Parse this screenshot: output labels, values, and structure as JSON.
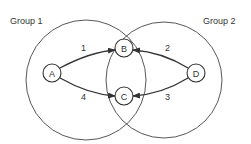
{
  "diagram": {
    "groups": [
      {
        "label": "Group 1",
        "cx": 86,
        "cy": 80,
        "r": 60
      },
      {
        "label": "Group 2",
        "cx": 164,
        "cy": 80,
        "r": 58
      }
    ],
    "nodes": [
      {
        "id": "A",
        "label": "A",
        "x": 52,
        "y": 73
      },
      {
        "id": "B",
        "label": "B",
        "x": 124,
        "y": 48
      },
      {
        "id": "C",
        "label": "C",
        "x": 124,
        "y": 96
      },
      {
        "id": "D",
        "label": "D",
        "x": 196,
        "y": 73
      }
    ],
    "edges": [
      {
        "from": "A",
        "to": "B",
        "label": "1"
      },
      {
        "from": "D",
        "to": "B",
        "label": "2"
      },
      {
        "from": "D",
        "to": "C",
        "label": "3"
      },
      {
        "from": "A",
        "to": "C",
        "label": "4"
      }
    ],
    "colors": {
      "stroke": "#333333",
      "background": "#ffffff"
    }
  }
}
